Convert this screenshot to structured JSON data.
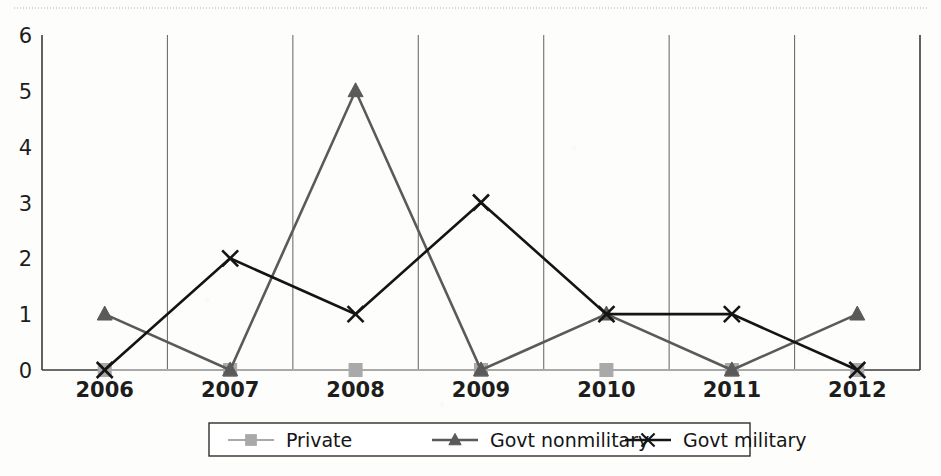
{
  "page": {
    "background_color": "#fdfdfc",
    "artifact_color": "#c8c8c8"
  },
  "chart_data": {
    "type": "line",
    "title": "",
    "subtitle": "",
    "xlabel": "",
    "ylabel": "",
    "categories": [
      "2006",
      "2007",
      "2008",
      "2009",
      "2010",
      "2011",
      "2012"
    ],
    "x": [
      2006,
      2007,
      2008,
      2009,
      2010,
      2011,
      2012
    ],
    "ylim": [
      0,
      6
    ],
    "yticks": [
      0,
      1,
      2,
      3,
      4,
      5,
      6
    ],
    "ytick_labels": [
      "0",
      "1",
      "2",
      "3",
      "4",
      "5",
      "6"
    ],
    "grid": "vertical-category-boundaries",
    "legend_position": "bottom-center",
    "series": [
      {
        "name": "Private",
        "values": [
          0,
          0,
          0,
          0,
          0,
          0,
          0
        ],
        "color": "#a9a9a9",
        "marker": "square"
      },
      {
        "name": "Govt nonmilitary",
        "values": [
          1,
          0,
          5,
          0,
          1,
          0,
          1
        ],
        "color": "#5a5a5a",
        "marker": "triangle"
      },
      {
        "name": "Govt military",
        "values": [
          0,
          2,
          1,
          3,
          1,
          1,
          0
        ],
        "color": "#141414",
        "marker": "x"
      }
    ]
  },
  "axes": {
    "y_axis_name": "value-axis",
    "x_axis_name": "year-axis"
  },
  "legend": {
    "items": [
      {
        "label": "Private"
      },
      {
        "label": "Govt nonmilitary"
      },
      {
        "label": "Govt military"
      }
    ]
  }
}
